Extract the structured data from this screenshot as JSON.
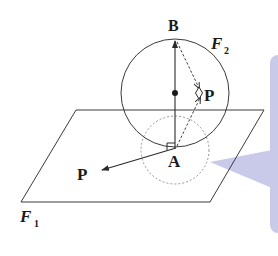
{
  "diagram": {
    "labels": {
      "B": "B",
      "A": "A",
      "P_side": "P",
      "P_left": "P",
      "F1_main": "F",
      "F1_sub": "1",
      "F2_main": "F",
      "F2_sub": "2"
    },
    "colors": {
      "stroke": "#3a3a3a",
      "dashed": "#7a7a7a",
      "bubble": "#c9c9ea",
      "background": "#ffffff"
    },
    "elements": {
      "plane": "F1 parallelogram plane",
      "sphere": "F2 sphere",
      "dashed_circle": "circle around A",
      "center_dot": "sphere center"
    }
  }
}
